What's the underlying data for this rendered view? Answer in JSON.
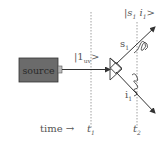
{
  "diagram": {
    "source_label": "source",
    "pump_state_label": "|1",
    "pump_state_sub": "uv",
    "pump_state_close": ">",
    "output_state_label": "|s",
    "output_state_sub1": "1",
    "output_state_mid": " i",
    "output_state_sub2": "1",
    "output_state_close": ">",
    "signal_label": "s",
    "signal_sub": "1",
    "idler_label": "i",
    "idler_sub": "1",
    "time_label": "time",
    "time_arrow": "→",
    "t1_label": "t",
    "t1_sub": "1",
    "t2_label": "t",
    "t2_sub": "2"
  },
  "colors": {
    "source_fill": "#6b6b6b",
    "line": "#333333",
    "dashed": "#888888",
    "text": "#555555"
  }
}
